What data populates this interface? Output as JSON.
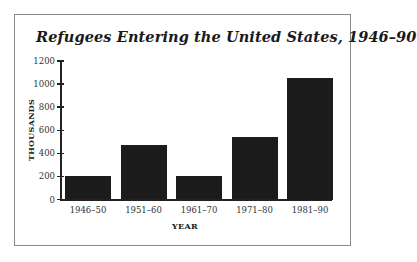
{
  "chart_data": {
    "type": "bar",
    "title": "Refugees Entering the United States, 1946–90",
    "xlabel": "YEAR",
    "ylabel": "THOUSANDS",
    "categories": [
      "1946–50",
      "1951–60",
      "1961–70",
      "1971–80",
      "1981–90"
    ],
    "values": [
      200,
      470,
      200,
      540,
      1050
    ],
    "ylim": [
      0,
      1200
    ],
    "yticks": [
      0,
      200,
      400,
      600,
      800,
      1000,
      1200
    ],
    "grid": false,
    "legend": null,
    "bar_color": "#1c1c1c"
  }
}
